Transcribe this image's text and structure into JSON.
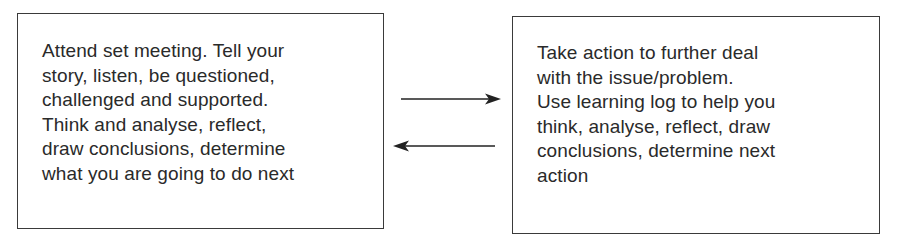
{
  "diagram": {
    "left_box": {
      "lines": [
        "Attend set meeting. Tell your",
        "story, listen, be questioned,",
        "challenged and supported.",
        "Think and analyse, reflect,",
        "draw conclusions, determine",
        "what you are going to do next"
      ]
    },
    "right_box": {
      "lines": [
        "Take action to further deal",
        "with the issue/problem.",
        "Use learning log to help you",
        "think, analyse, reflect, draw",
        "conclusions, determine next",
        "action"
      ]
    },
    "arrows": [
      {
        "direction": "right",
        "from": "left_box",
        "to": "right_box"
      },
      {
        "direction": "left",
        "from": "right_box",
        "to": "left_box"
      }
    ],
    "colors": {
      "stroke": "#3a3a3a",
      "text": "#2a2a2a",
      "background": "#ffffff"
    }
  }
}
